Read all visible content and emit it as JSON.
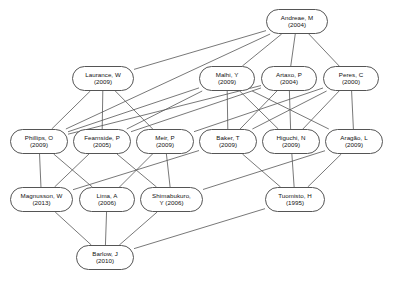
{
  "diagram": {
    "type": "citation-network",
    "background_color": "#ffffff",
    "node_border_color": "#555555",
    "node_fill_color": "#ffffff",
    "edge_color": "#555555",
    "text_color": "#111111",
    "layers": 5,
    "node_count": 16,
    "edge_count": 35,
    "nodes": [
      {
        "id": "andreae",
        "name": "Andreae, M",
        "year": "(2004)",
        "layer": 1,
        "x": 266,
        "y": 9,
        "w": 62,
        "h": 25
      },
      {
        "id": "laurance",
        "name": "Laurance, W",
        "year": "(2009)",
        "layer": 2,
        "x": 72,
        "y": 66,
        "w": 62,
        "h": 25
      },
      {
        "id": "malhi",
        "name": "Malhi, Y",
        "year": "(2009)",
        "layer": 2,
        "x": 199,
        "y": 66,
        "w": 56,
        "h": 25
      },
      {
        "id": "artaxo",
        "name": "Artaxo, P",
        "year": "(2004)",
        "layer": 2,
        "x": 261,
        "y": 66,
        "w": 56,
        "h": 25
      },
      {
        "id": "peres",
        "name": "Peres, C",
        "year": "(2000)",
        "layer": 2,
        "x": 323,
        "y": 66,
        "w": 56,
        "h": 25
      },
      {
        "id": "phillips",
        "name": "Phillips, O",
        "year": "(2009)",
        "layer": 3,
        "x": 10,
        "y": 129,
        "w": 58,
        "h": 25
      },
      {
        "id": "fearnside",
        "name": "Fearnside, P",
        "year": "(2005)",
        "layer": 3,
        "x": 73,
        "y": 129,
        "w": 58,
        "h": 25
      },
      {
        "id": "meir",
        "name": "Meir, P",
        "year": "(2009)",
        "layer": 3,
        "x": 136,
        "y": 129,
        "w": 58,
        "h": 25
      },
      {
        "id": "baker",
        "name": "Baker, T",
        "year": "(2009)",
        "layer": 3,
        "x": 199,
        "y": 129,
        "w": 58,
        "h": 25
      },
      {
        "id": "higuchi",
        "name": "Higuchi, N",
        "year": "(2009)",
        "layer": 3,
        "x": 262,
        "y": 129,
        "w": 58,
        "h": 25
      },
      {
        "id": "aragao",
        "name": "Aragão, L",
        "year": "(2009)",
        "layer": 3,
        "x": 325,
        "y": 129,
        "w": 58,
        "h": 25
      },
      {
        "id": "magnusson",
        "name": "Magnusson, W",
        "year": "(2013)",
        "layer": 4,
        "x": 10,
        "y": 187,
        "w": 63,
        "h": 25
      },
      {
        "id": "lima",
        "name": "Lima, A",
        "year": "(2006)",
        "layer": 4,
        "x": 79,
        "y": 187,
        "w": 56,
        "h": 25
      },
      {
        "id": "shimabukuro",
        "name": "Shimabukuro,",
        "year": "Y (2006)",
        "layer": 4,
        "x": 140,
        "y": 187,
        "w": 63,
        "h": 25
      },
      {
        "id": "tuomisto",
        "name": "Tuomisto, H",
        "year": "(1995)",
        "layer": 4,
        "x": 265,
        "y": 187,
        "w": 60,
        "h": 25
      },
      {
        "id": "barlow",
        "name": "Barlow, J",
        "year": "(2010)",
        "layer": 5,
        "x": 76,
        "y": 245,
        "w": 58,
        "h": 25
      }
    ],
    "edges": [
      {
        "from": "andreae",
        "to": "laurance"
      },
      {
        "from": "andreae",
        "to": "malhi"
      },
      {
        "from": "andreae",
        "to": "artaxo"
      },
      {
        "from": "andreae",
        "to": "peres"
      },
      {
        "from": "andreae",
        "to": "phillips"
      },
      {
        "from": "laurance",
        "to": "phillips"
      },
      {
        "from": "laurance",
        "to": "fearnside"
      },
      {
        "from": "laurance",
        "to": "meir"
      },
      {
        "from": "malhi",
        "to": "baker"
      },
      {
        "from": "malhi",
        "to": "higuchi"
      },
      {
        "from": "malhi",
        "to": "aragao"
      },
      {
        "from": "malhi",
        "to": "phillips"
      },
      {
        "from": "malhi",
        "to": "fearnside"
      },
      {
        "from": "artaxo",
        "to": "baker"
      },
      {
        "from": "artaxo",
        "to": "higuchi"
      },
      {
        "from": "artaxo",
        "to": "phillips"
      },
      {
        "from": "artaxo",
        "to": "fearnside"
      },
      {
        "from": "peres",
        "to": "higuchi"
      },
      {
        "from": "peres",
        "to": "aragao"
      },
      {
        "from": "peres",
        "to": "baker"
      },
      {
        "from": "peres",
        "to": "meir"
      },
      {
        "from": "phillips",
        "to": "magnusson"
      },
      {
        "from": "phillips",
        "to": "lima"
      },
      {
        "from": "fearnside",
        "to": "magnusson"
      },
      {
        "from": "fearnside",
        "to": "shimabukuro"
      },
      {
        "from": "meir",
        "to": "lima"
      },
      {
        "from": "meir",
        "to": "shimabukuro"
      },
      {
        "from": "baker",
        "to": "tuomisto"
      },
      {
        "from": "baker",
        "to": "magnusson"
      },
      {
        "from": "higuchi",
        "to": "tuomisto"
      },
      {
        "from": "aragao",
        "to": "tuomisto"
      },
      {
        "from": "aragao",
        "to": "shimabukuro"
      },
      {
        "from": "magnusson",
        "to": "barlow"
      },
      {
        "from": "lima",
        "to": "barlow"
      },
      {
        "from": "shimabukuro",
        "to": "barlow"
      },
      {
        "from": "tuomisto",
        "to": "barlow"
      }
    ]
  }
}
